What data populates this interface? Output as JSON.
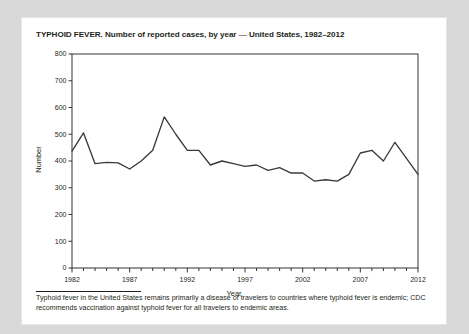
{
  "figure": {
    "title": "TYPHOID FEVER. Number of reported cases, by year — United States, 1982–2012",
    "footnote": "Typhoid fever in the United States remains primarily a disease of travelers to countries where typhoid fever is endemic; CDC recommends vaccination against typhoid fever for all travelers to endemic areas."
  },
  "colors": {
    "page_background": "#d9d9d9",
    "card_background": "#ffffff",
    "ink": "#231f20",
    "line": "#3a3a3a"
  },
  "chart_data": {
    "type": "line",
    "title": "TYPHOID FEVER. Number of reported cases, by year — United States, 1982–2012",
    "xlabel": "Year",
    "ylabel": "Number",
    "xlim": [
      1982,
      2012
    ],
    "ylim": [
      0,
      800
    ],
    "ytick_step": 100,
    "yticks": [
      0,
      100,
      200,
      300,
      400,
      500,
      600,
      700,
      800
    ],
    "ytick_labels": [
      "0",
      "100",
      "200",
      "300",
      "400",
      "500",
      "600",
      "700",
      "800"
    ],
    "xticks_major": [
      1982,
      1987,
      1992,
      1997,
      2002,
      2007,
      2012
    ],
    "xtick_labels": [
      "1982",
      "1987",
      "1992",
      "1997",
      "2002",
      "2007",
      "2012"
    ],
    "xticks_minor_step": 1,
    "grid": false,
    "legend": false,
    "x": [
      1982,
      1983,
      1984,
      1985,
      1986,
      1987,
      1988,
      1989,
      1990,
      1991,
      1992,
      1993,
      1994,
      1995,
      1996,
      1997,
      1998,
      1999,
      2000,
      2001,
      2002,
      2003,
      2004,
      2005,
      2006,
      2007,
      2008,
      2009,
      2010,
      2011,
      2012
    ],
    "values": [
      437,
      505,
      390,
      395,
      393,
      370,
      400,
      440,
      565,
      500,
      440,
      440,
      385,
      400,
      390,
      380,
      385,
      365,
      375,
      355,
      355,
      325,
      330,
      325,
      350,
      430,
      440,
      400,
      470,
      410,
      350
    ],
    "series": [
      {
        "name": "Reported cases",
        "values": [
          437,
          505,
          390,
          395,
          393,
          370,
          400,
          440,
          565,
          500,
          440,
          440,
          385,
          400,
          390,
          380,
          385,
          365,
          375,
          355,
          355,
          325,
          330,
          325,
          350,
          430,
          440,
          400,
          470,
          410,
          350
        ]
      }
    ]
  }
}
